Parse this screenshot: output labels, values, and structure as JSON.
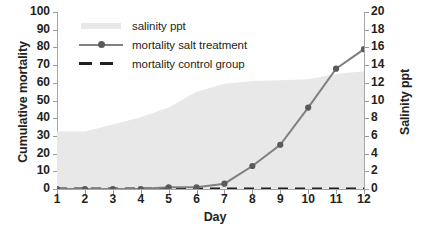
{
  "chart_data": {
    "type": "line",
    "title": "",
    "xlabel": "Day",
    "ylabel": "Cumulative mortality",
    "y2label": "Salinity ppt",
    "x": [
      1,
      2,
      3,
      4,
      5,
      6,
      7,
      8,
      9,
      10,
      11,
      12
    ],
    "xlim": [
      1,
      12
    ],
    "ylim": [
      0,
      100
    ],
    "y2lim": [
      0,
      20
    ],
    "yticks": [
      0,
      10,
      20,
      30,
      40,
      50,
      60,
      70,
      80,
      90,
      100
    ],
    "y2ticks": [
      0,
      2,
      4,
      6,
      8,
      10,
      12,
      14,
      16,
      18,
      20
    ],
    "xticks": [
      1,
      2,
      3,
      4,
      5,
      6,
      7,
      8,
      9,
      10,
      11,
      12
    ],
    "grid": false,
    "legend_position": "top-left",
    "series": [
      {
        "name": "salinity ppt",
        "type": "area",
        "axis": "right",
        "color": "#e8e8e8",
        "values": [
          6.5,
          6.5,
          7.3,
          8.1,
          9.2,
          11.0,
          11.9,
          12.2,
          12.3,
          12.4,
          13.0,
          13.3
        ]
      },
      {
        "name": "mortality salt treatment",
        "type": "line-marker",
        "axis": "left",
        "color": "#808080",
        "marker_color": "#595959",
        "values": [
          0,
          0,
          0,
          0,
          1,
          1,
          3,
          13,
          25,
          46,
          68,
          79
        ]
      },
      {
        "name": "mortality control group",
        "type": "line-dashed",
        "axis": "left",
        "color": "#231f20",
        "values": [
          0,
          0,
          0,
          0,
          0,
          0,
          0,
          0,
          0,
          0,
          0,
          0
        ]
      }
    ]
  },
  "legend": {
    "items": [
      {
        "label": "salinity ppt",
        "key": "area-swatch"
      },
      {
        "label": "mortality salt treatment",
        "key": "line-marker-swatch"
      },
      {
        "label": "mortality control group",
        "key": "dashed-line-swatch"
      }
    ]
  },
  "axes": {
    "x_title": "Day",
    "y_left_title": "Cumulative mortality",
    "y_right_title": "Salinity ppt"
  },
  "colors": {
    "area_fill": "#e8e8e8",
    "salt_line": "#808080",
    "salt_marker": "#595959",
    "control_line": "#231f20",
    "axis": "#a6a6a6",
    "text": "#231f20"
  }
}
